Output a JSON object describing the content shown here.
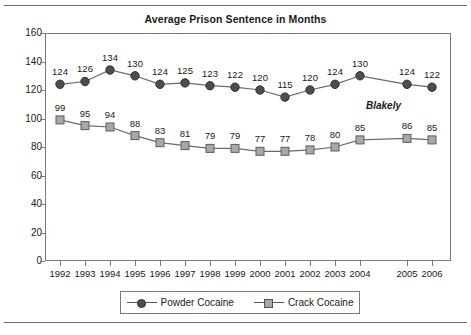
{
  "chart_data": {
    "type": "line",
    "title": "Average Prison Sentence in Months",
    "xlabel": "",
    "ylabel": "",
    "ylim": [
      0,
      160
    ],
    "ytick_step": 20,
    "yticks": [
      "160",
      "140",
      "120",
      "100",
      "80",
      "60",
      "40",
      "20",
      "0"
    ],
    "categories": [
      "1992",
      "1993",
      "1994",
      "1995",
      "1996",
      "1997",
      "1998",
      "1999",
      "2000",
      "2001",
      "2002",
      "2003",
      "2004",
      "2005",
      "2006"
    ],
    "grid": false,
    "legend_position": "bottom",
    "series": [
      {
        "name": "Powder Cocaine",
        "marker": "circle",
        "color": "#4d4d4d",
        "values": [
          124,
          126,
          134,
          130,
          124,
          125,
          123,
          122,
          120,
          115,
          120,
          124,
          130,
          124,
          122
        ]
      },
      {
        "name": "Crack Cocaine",
        "marker": "square",
        "color": "#a8a8a8",
        "values": [
          99,
          95,
          94,
          88,
          83,
          81,
          79,
          79,
          77,
          77,
          78,
          80,
          85,
          86,
          85
        ]
      }
    ],
    "annotations": [
      {
        "text": "Blakely"
      }
    ]
  },
  "legend": {
    "items": [
      {
        "label": "Powder Cocaine"
      },
      {
        "label": "Crack Cocaine"
      }
    ]
  }
}
